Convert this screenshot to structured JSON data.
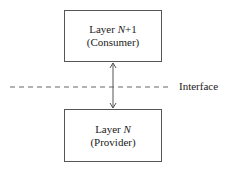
{
  "diagram": {
    "top_box": {
      "line1_prefix": "Layer ",
      "line1_var": "N",
      "line1_suffix": "+1",
      "line2": "(Consumer)"
    },
    "bottom_box": {
      "line1_prefix": "Layer ",
      "line1_var": "N",
      "line2": "(Provider)"
    },
    "interface_label": "Interface",
    "colors": {
      "stroke": "#555555",
      "text": "#222222",
      "background": "#ffffff"
    }
  }
}
